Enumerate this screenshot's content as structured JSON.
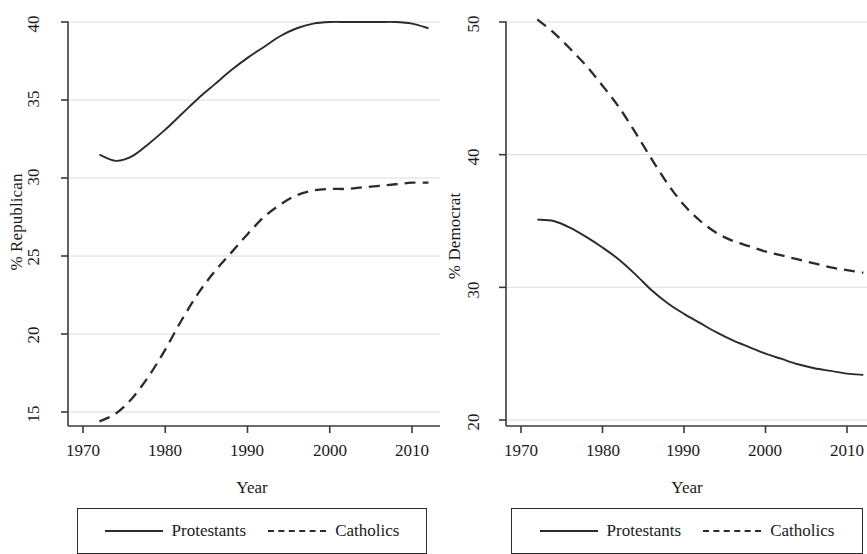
{
  "figure": {
    "background": "#ffffff",
    "line_color": "#2b2b2b",
    "grid_color": "#dcdcdc",
    "axis_color": "#3a3a3a"
  },
  "panels": [
    {
      "id": "republican",
      "ylabel": "% Republican",
      "xlabel": "Year",
      "xticks": [
        "1970",
        "1980",
        "1990",
        "2000",
        "2010"
      ],
      "yticks": [
        "15",
        "20",
        "25",
        "30",
        "35",
        "40"
      ],
      "legend": {
        "series": [
          {
            "label": "Protestants",
            "style": "solid"
          },
          {
            "label": "Catholics",
            "style": "dashed"
          }
        ]
      }
    },
    {
      "id": "democrat",
      "ylabel": "% Democrat",
      "xlabel": "Year",
      "xticks": [
        "1970",
        "1980",
        "1990",
        "2000",
        "2010"
      ],
      "yticks": [
        "20",
        "30",
        "40",
        "50"
      ],
      "legend": {
        "series": [
          {
            "label": "Protestants",
            "style": "solid"
          },
          {
            "label": "Catholics",
            "style": "dashed"
          }
        ]
      }
    }
  ],
  "chart_data": [
    {
      "type": "line",
      "title": "",
      "xlabel": "Year",
      "ylabel": "% Republican",
      "xlim": [
        1968,
        2013.5
      ],
      "ylim": [
        13.5,
        40.6
      ],
      "xticks": [
        1970,
        1980,
        1990,
        2000,
        2010
      ],
      "yticks": [
        15,
        20,
        25,
        30,
        35,
        40
      ],
      "grid": "horizontal",
      "legend_position": "below-axes",
      "x": [
        1972,
        1974,
        1976,
        1978,
        1980,
        1982,
        1984,
        1986,
        1988,
        1990,
        1992,
        1994,
        1996,
        1998,
        2000,
        2002,
        2004,
        2006,
        2008,
        2010,
        2012
      ],
      "series": [
        {
          "name": "Protestants",
          "style": "solid",
          "values": [
            31.5,
            31.1,
            31.4,
            32.2,
            33.1,
            34.1,
            35.1,
            36.0,
            36.9,
            37.7,
            38.4,
            39.1,
            39.6,
            39.9,
            40.0,
            40.0,
            40.0,
            40.0,
            40.0,
            39.9,
            39.6
          ]
        },
        {
          "name": "Catholics",
          "style": "dashed",
          "values": [
            14.4,
            14.9,
            15.9,
            17.3,
            19.0,
            20.9,
            22.6,
            24.0,
            25.2,
            26.4,
            27.5,
            28.3,
            28.9,
            29.2,
            29.3,
            29.3,
            29.4,
            29.5,
            29.6,
            29.7,
            29.7
          ]
        }
      ]
    },
    {
      "type": "line",
      "title": "",
      "xlabel": "Year",
      "ylabel": "% Democrat",
      "xlim": [
        1968,
        2013.5
      ],
      "ylim": [
        19.0,
        51.2
      ],
      "xticks": [
        1970,
        1980,
        1990,
        2000,
        2010
      ],
      "yticks": [
        20,
        30,
        40,
        50
      ],
      "grid": "horizontal",
      "legend_position": "below-axes",
      "x": [
        1972,
        1974,
        1976,
        1978,
        1980,
        1982,
        1984,
        1986,
        1988,
        1990,
        1992,
        1994,
        1996,
        1998,
        2000,
        2002,
        2004,
        2006,
        2008,
        2010,
        2012
      ],
      "series": [
        {
          "name": "Protestants",
          "style": "solid",
          "values": [
            35.1,
            35.0,
            34.5,
            33.8,
            33.0,
            32.1,
            31.0,
            29.8,
            28.8,
            28.0,
            27.3,
            26.6,
            26.0,
            25.5,
            25.0,
            24.6,
            24.2,
            23.9,
            23.7,
            23.5,
            23.4
          ]
        },
        {
          "name": "Catholics",
          "style": "dashed",
          "values": [
            50.2,
            49.2,
            48.0,
            46.7,
            45.2,
            43.6,
            41.7,
            39.7,
            37.8,
            36.2,
            35.0,
            34.1,
            33.5,
            33.1,
            32.7,
            32.4,
            32.1,
            31.8,
            31.5,
            31.3,
            31.1
          ]
        }
      ]
    }
  ]
}
